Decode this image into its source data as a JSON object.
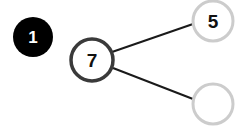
{
  "step_badge": {
    "label": "1",
    "color": "#000000",
    "text_color": "#ffffff"
  },
  "tree": {
    "root": {
      "value": "7",
      "stroke": "#3a3a3a"
    },
    "children": [
      {
        "value": "5",
        "stroke": "#cccccc"
      },
      {
        "value": "",
        "stroke": "#cccccc"
      }
    ],
    "edge_color": "#1a1a1a"
  }
}
